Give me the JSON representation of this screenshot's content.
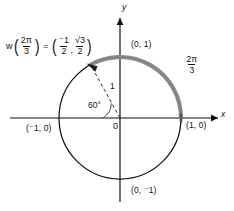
{
  "figure": {
    "type": "unit-circle-diagram",
    "title_equation": {
      "function_symbol": "w",
      "argument": {
        "numerator": "2π",
        "denominator": "3"
      },
      "equals": "=",
      "point_x": {
        "numerator": "⁻1",
        "denominator": "2"
      },
      "comma": ",",
      "point_y": {
        "numerator": "√3",
        "denominator": "2"
      },
      "plain_text": "w(2π/3) = (-1/2, √3/2)"
    },
    "arc_label": {
      "numerator": "2π",
      "denominator": "3"
    },
    "angle_label": "60°",
    "radius_label": "1",
    "origin_label": "0",
    "axis_labels": {
      "x": "x",
      "y": "y"
    },
    "points": [
      {
        "name": "top",
        "label": "(0, 1)"
      },
      {
        "name": "bottom",
        "label": "(0, ⁻1)"
      },
      {
        "name": "left",
        "label": "(⁻1, 0)"
      },
      {
        "name": "right",
        "label": "(1, 0)"
      }
    ],
    "colors": {
      "background": "#ffffff",
      "circle_stroke": "#111111",
      "arc_highlight": "#8c8c8c",
      "axis": "#111111",
      "dashed_radius": "#333333",
      "text": "#111111"
    },
    "geometry": {
      "center_x": 120,
      "center_y": 118,
      "radius": 61,
      "terminal_angle_degrees": 120,
      "arc_start_degrees": 0,
      "arc_end_degrees": 120,
      "arc_direction": "counterclockwise"
    }
  }
}
